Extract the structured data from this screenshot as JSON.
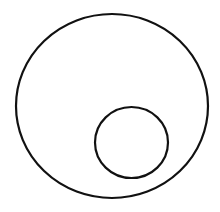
{
  "diagram": {
    "type": "nested-circles",
    "background": "#ffffff",
    "stroke_color": "#111111",
    "shapes": [
      {
        "name": "outer-circle",
        "cx": 112,
        "cy": 106,
        "rx": 96,
        "ry": 92,
        "stroke_width": 2.2,
        "fill": "none"
      },
      {
        "name": "inner-circle",
        "cx": 131.5,
        "cy": 142.5,
        "rx": 36.5,
        "ry": 35.5,
        "stroke_width": 2.2,
        "fill": "none"
      }
    ]
  }
}
